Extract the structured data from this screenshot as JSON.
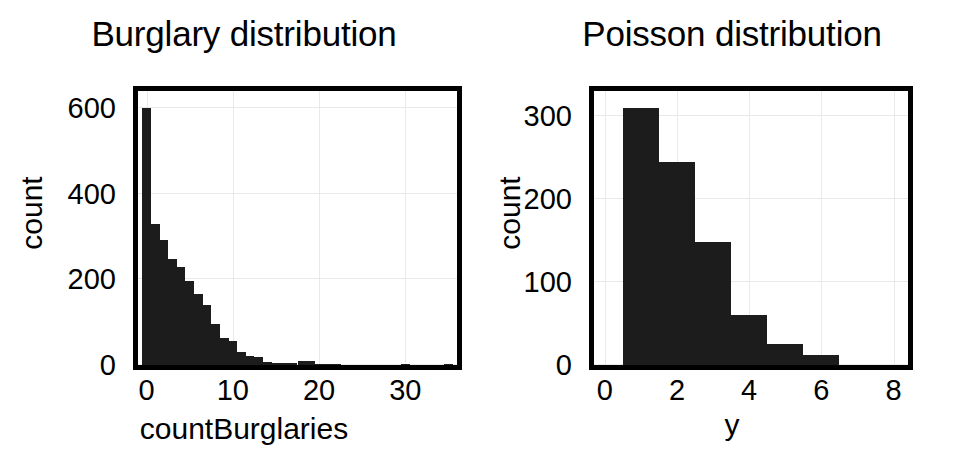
{
  "figure": {
    "background_color": "#ffffff",
    "bar_color": "#1c1c1c",
    "grid_color": "#e9e9e9",
    "axis_color": "#000000"
  },
  "panels": [
    {
      "id": "burglary",
      "title": "Burglary distribution",
      "xlabel": "countBurglaries",
      "ylabel": "count"
    },
    {
      "id": "poisson",
      "title": "Poisson distribution",
      "xlabel": "y",
      "ylabel": "count"
    }
  ],
  "chart_data": [
    {
      "type": "bar",
      "title": "Burglary distribution",
      "xlabel": "countBurglaries",
      "ylabel": "count",
      "xlim": [
        -1,
        36
      ],
      "ylim": [
        0,
        640
      ],
      "xticks": [
        0,
        10,
        20,
        30
      ],
      "xtick_labels": [
        "0",
        "10",
        "20",
        "30"
      ],
      "yticks": [
        0,
        200,
        400,
        600
      ],
      "ytick_labels": [
        "0",
        "200",
        "400",
        "600"
      ],
      "grid": true,
      "legend": "none",
      "bin_width": 1,
      "x": [
        0,
        1,
        2,
        3,
        4,
        5,
        6,
        7,
        8,
        9,
        10,
        11,
        12,
        13,
        14,
        15,
        16,
        17,
        18,
        19,
        20,
        21,
        22,
        23,
        24,
        25,
        26,
        27,
        28,
        29,
        30,
        31,
        32,
        33,
        34,
        35
      ],
      "values": [
        600,
        330,
        292,
        248,
        230,
        196,
        165,
        140,
        96,
        62,
        56,
        30,
        22,
        18,
        6,
        5,
        4,
        4,
        9,
        9,
        2,
        1,
        1,
        0,
        0,
        0,
        0,
        0,
        0,
        0,
        1,
        0,
        0,
        0,
        0,
        1
      ]
    },
    {
      "type": "bar",
      "title": "Poisson distribution",
      "xlabel": "y",
      "ylabel": "count",
      "xlim": [
        -0.3,
        8.4
      ],
      "ylim": [
        0,
        330
      ],
      "xticks": [
        0,
        2,
        4,
        6,
        8
      ],
      "xtick_labels": [
        "0",
        "2",
        "4",
        "6",
        "8"
      ],
      "yticks": [
        0,
        100,
        200,
        300
      ],
      "ytick_labels": [
        "0",
        "100",
        "200",
        "300"
      ],
      "grid": true,
      "legend": "none",
      "bin_width": 1,
      "bin_starts": [
        0.5,
        1.5,
        2.5,
        3.5,
        4.5,
        5.5
      ],
      "categories": [
        "0.5-1.5",
        "1.5-2.5",
        "2.5-3.5",
        "3.5-4.5",
        "4.5-5.5",
        "5.5-6.5"
      ],
      "values": [
        310,
        245,
        148,
        60,
        25,
        12
      ]
    }
  ]
}
